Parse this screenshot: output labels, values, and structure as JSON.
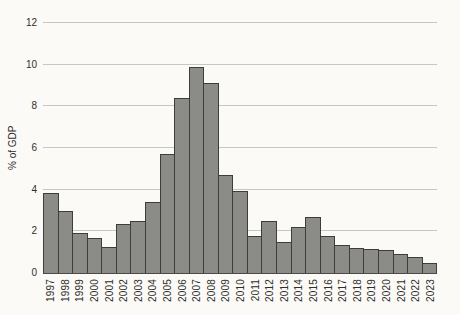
{
  "chart_data": {
    "type": "bar",
    "title": "",
    "xlabel": "",
    "ylabel": "% of GDP",
    "categories": [
      "1997",
      "1998",
      "1999",
      "2000",
      "2001",
      "2002",
      "2003",
      "2004",
      "2005",
      "2006",
      "2007",
      "2008",
      "2009",
      "2010",
      "2011",
      "2012",
      "2013",
      "2014",
      "2015",
      "2016",
      "2017",
      "2018",
      "2019",
      "2020",
      "2021",
      "2022",
      "2023"
    ],
    "values": [
      3.85,
      3.0,
      1.9,
      1.7,
      1.25,
      2.35,
      2.5,
      3.4,
      5.7,
      8.4,
      9.9,
      9.1,
      4.7,
      3.95,
      1.8,
      2.5,
      1.5,
      2.2,
      2.7,
      1.8,
      1.35,
      1.2,
      1.15,
      1.1,
      0.9,
      0.75,
      0.5
    ],
    "ylim": [
      0,
      12
    ],
    "yticks": [
      0,
      2,
      4,
      6,
      8,
      10,
      12
    ],
    "grid": true,
    "legend": null,
    "colors": {
      "bar_fill": "#8b8b87",
      "bar_stroke": "#3d3d3a",
      "gridline": "#c6c6c2",
      "axis_line": "#4a4a47",
      "text": "#2e2e2b",
      "background": "#fbfaf7"
    }
  }
}
